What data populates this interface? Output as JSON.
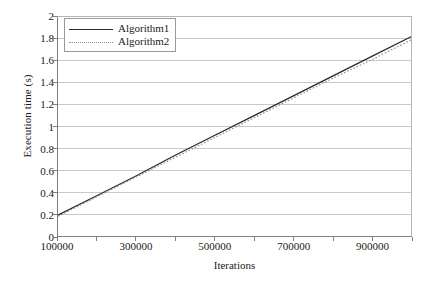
{
  "chart_data": {
    "type": "line",
    "title": "",
    "xlabel": "Iterations",
    "ylabel": "Execution time (s)",
    "xlim": [
      100000,
      1000000
    ],
    "ylim": [
      0,
      2
    ],
    "grid": "horizontal",
    "legend_position": "top-left-inside",
    "x": [
      100000,
      200000,
      300000,
      400000,
      500000,
      600000,
      700000,
      800000,
      900000,
      1000000
    ],
    "xticks": [
      100000,
      200000,
      300000,
      400000,
      500000,
      600000,
      700000,
      800000,
      900000,
      1000000
    ],
    "xtick_labels": [
      "100000",
      "",
      "300000",
      "",
      "500000",
      "",
      "700000",
      "",
      "900000",
      ""
    ],
    "yticks": [
      0,
      0.2,
      0.4,
      0.6,
      0.8,
      1,
      1.2,
      1.4,
      1.6,
      1.8,
      2
    ],
    "ytick_labels": [
      "0",
      "0.2",
      "0.4",
      "0.6",
      "0.8",
      "1",
      "1.2",
      "1.4",
      "1.6",
      "1.8",
      "2"
    ],
    "series": [
      {
        "name": "Algorithm1",
        "style": "solid",
        "color": "#2b2b2b",
        "values": [
          0.19,
          0.37,
          0.55,
          0.74,
          0.92,
          1.1,
          1.28,
          1.46,
          1.64,
          1.82
        ]
      },
      {
        "name": "Algorithm2",
        "style": "dotted",
        "color": "#8f8f8f",
        "values": [
          0.18,
          0.36,
          0.54,
          0.72,
          0.9,
          1.08,
          1.26,
          1.44,
          1.61,
          1.79
        ]
      }
    ]
  },
  "legend": {
    "entries": [
      {
        "label": "Algorithm1"
      },
      {
        "label": "Algorithm2"
      }
    ]
  },
  "colors": {
    "series1": "#2b2b2b",
    "series2": "#8f8f8f",
    "gridline": "#c9c9c9",
    "axis": "#808080",
    "background": "#ffffff"
  }
}
